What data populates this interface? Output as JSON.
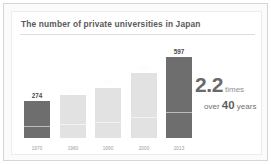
{
  "chart_data": {
    "type": "bar",
    "title": "The number of private universities in Japan",
    "xlabel": "",
    "ylabel": "",
    "ylim": [
      0,
      650
    ],
    "grid": false,
    "legend": null,
    "categories": [
      "1970",
      "1980",
      "1990",
      "2000",
      "2013"
    ],
    "values": [
      274,
      319,
      372,
      478,
      597
    ],
    "value_labels": [
      "274",
      "319",
      "372",
      "478",
      "597"
    ],
    "bar_styles": [
      "dark",
      "light",
      "light",
      "light",
      "dark"
    ],
    "label_styles": [
      "dark",
      "light",
      "light",
      "light",
      "dark"
    ],
    "annotations": {
      "multiplier": "2.2",
      "times": "times",
      "over": "over",
      "years_number": "40",
      "years_word": "years"
    }
  },
  "colors": {
    "bar_dark": "#6e6e6e",
    "bar_light": "#e2e2e2",
    "title_text": "#5a5a5a",
    "frame": "#d6d6d6",
    "panel_bg": "#ffffff"
  }
}
